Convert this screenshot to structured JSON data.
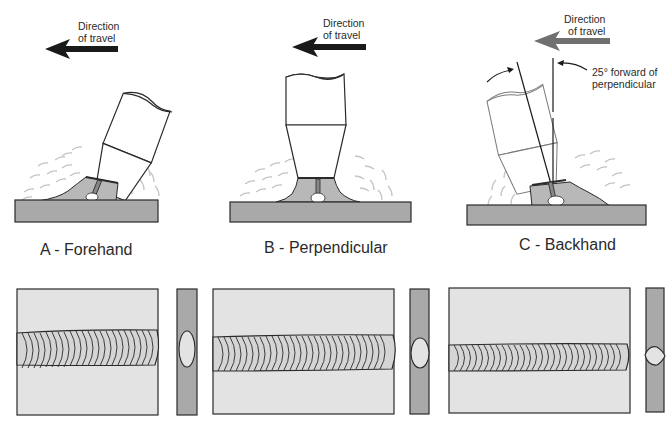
{
  "diagram": {
    "colors": {
      "plate_fill": "#a9a9a9",
      "plate_top_fill": "#e3e3e3",
      "weld_fill": "#b8b8b8",
      "outline": "#2a2a2a",
      "arrow_dark": "#1a1a1a",
      "arrow_gray": "#707070",
      "spatter": "#bdbdbd"
    },
    "panels": [
      {
        "id": "A",
        "label": "A - Forehand",
        "direction_label_line1": "Direction",
        "direction_label_line2": "of travel",
        "arrow_color": "#1a1a1a",
        "torch_angle": "tilted toward travel",
        "bead_profile": "wide, flat"
      },
      {
        "id": "B",
        "label": "B - Perpendicular",
        "direction_label_line1": "Direction",
        "direction_label_line2": "of travel",
        "arrow_color": "#1a1a1a",
        "torch_angle": "perpendicular",
        "bead_profile": "medium"
      },
      {
        "id": "C",
        "label": "C - Backhand",
        "direction_label_line1": "Direction",
        "direction_label_line2": "of travel",
        "arrow_color": "#707070",
        "torch_angle": "tilted away from travel",
        "annotation_line1": "25° forward of",
        "annotation_line2": "perpendicular",
        "bead_profile": "narrow, high penetration"
      }
    ]
  }
}
